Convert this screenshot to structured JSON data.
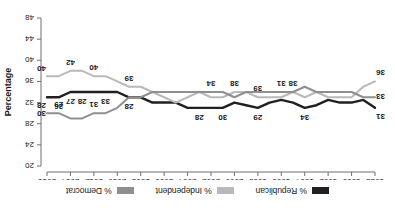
{
  "legend": {
    "position": "top-center",
    "entries": [
      {
        "name": "republican",
        "label": "% Republican",
        "color": "#231f20"
      },
      {
        "name": "independent",
        "label": "% Independent",
        "color": "#b9b9b9"
      },
      {
        "name": "democrat",
        "label": "% Democrat",
        "color": "#8f8f8f"
      }
    ]
  },
  "axes": {
    "y_title": "Percentage",
    "y_ticks": [
      "20",
      "24",
      "28",
      "32",
      "36",
      "40",
      "44",
      "48"
    ],
    "x_ticks": [
      "1988",
      "1990",
      "1992",
      "1994",
      "1996",
      "1998",
      "2000",
      "2002",
      "2004",
      "2006",
      "2008",
      "2010",
      "2012",
      "2014",
      "2016"
    ]
  },
  "chart_data": {
    "type": "line",
    "title": "",
    "subtitle": "",
    "xlabel": "",
    "ylabel": "Percentage",
    "ylim": [
      20,
      48
    ],
    "ytick_step": 4,
    "grid": false,
    "legend_position": "top-center",
    "x": [
      1988,
      1989,
      1990,
      1991,
      1992,
      1993,
      1994,
      1995,
      1996,
      1997,
      1998,
      1999,
      2000,
      2001,
      2002,
      2003,
      2004,
      2005,
      2006,
      2007,
      2008,
      2009,
      2010,
      2011,
      2012,
      2013,
      2014,
      2015,
      2016
    ],
    "categories": [
      "1988",
      "1989",
      "1990",
      "1991",
      "1992",
      "1993",
      "1994",
      "1995",
      "1996",
      "1997",
      "1998",
      "1999",
      "2000",
      "2001",
      "2002",
      "2003",
      "2004",
      "2005",
      "2006",
      "2007",
      "2008",
      "2009",
      "2010",
      "2011",
      "2012",
      "2013",
      "2014",
      "2015",
      "2016"
    ],
    "series": [
      {
        "name": "% Republican",
        "color": "#231f20",
        "values": [
          31,
          32.5,
          32,
          32,
          32.5,
          31.5,
          31,
          32,
          32.5,
          32,
          31,
          31.5,
          32,
          31,
          31,
          31,
          31,
          32,
          32,
          32,
          33,
          33,
          34,
          34,
          34,
          34,
          34,
          33,
          33
        ]
      },
      {
        "name": "% Independent",
        "color": "#b9b9b9",
        "values": [
          36,
          35,
          33,
          33,
          33,
          34,
          33,
          34,
          33,
          33,
          33,
          34,
          34,
          33,
          33,
          34,
          33,
          32,
          33,
          34,
          35,
          35,
          36,
          37,
          37,
          38,
          38,
          37,
          37
        ]
      },
      {
        "name": "% Democrat",
        "color": "#8f8f8f",
        "values": [
          33,
          33,
          34,
          34,
          34,
          34,
          35,
          34,
          34,
          34,
          34,
          34,
          33,
          34,
          34,
          34,
          34,
          34,
          34,
          34,
          33,
          33,
          31,
          30,
          30,
          29,
          29,
          30,
          30
        ]
      }
    ],
    "data_labels": [
      {
        "series": "% Republican",
        "x": 1988,
        "value": 31
      },
      {
        "series": "% Republican",
        "x": 1994,
        "value": 34
      },
      {
        "series": "% Republican",
        "x": 1998,
        "value": 29
      },
      {
        "series": "% Republican",
        "x": 2001,
        "value": 30
      },
      {
        "series": "% Republican",
        "x": 2003,
        "value": 28
      },
      {
        "series": "% Republican",
        "x": 2009,
        "value": 28
      },
      {
        "series": "% Republican",
        "x": 2011,
        "value": 33
      },
      {
        "series": "% Republican",
        "x": 2013,
        "value": 28
      },
      {
        "series": "% Republican",
        "x": 2014,
        "value": 27
      },
      {
        "series": "% Republican",
        "x": 2015,
        "value": 26
      },
      {
        "series": "% Republican",
        "x": 2016,
        "value": 28
      },
      {
        "series": "% Independent",
        "x": 1988,
        "value": 36
      },
      {
        "series": "% Independent",
        "x": 1995,
        "value": 38
      },
      {
        "series": "% Independent",
        "x": 1998,
        "value": 39
      },
      {
        "series": "% Independent",
        "x": 2000,
        "value": 38
      },
      {
        "series": "% Independent",
        "x": 2009,
        "value": 39
      },
      {
        "series": "% Independent",
        "x": 2012,
        "value": 40
      },
      {
        "series": "% Independent",
        "x": 2014,
        "value": 42
      },
      {
        "series": "% Independent",
        "x": 2016,
        "value": 40
      },
      {
        "series": "% Democrat",
        "x": 1988,
        "value": 33
      },
      {
        "series": "% Democrat",
        "x": 1996,
        "value": 31
      },
      {
        "series": "% Democrat",
        "x": 2002,
        "value": 34
      },
      {
        "series": "% Democrat",
        "x": 2012,
        "value": 31
      },
      {
        "series": "% Democrat",
        "x": 2015,
        "value": 29
      },
      {
        "series": "% Democrat",
        "x": 2016,
        "value": 30
      }
    ]
  }
}
